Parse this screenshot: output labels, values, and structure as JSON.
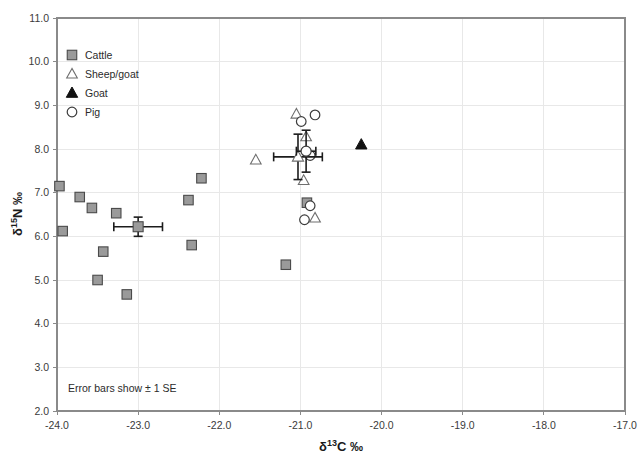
{
  "chart_data": {
    "type": "scatter",
    "title": "",
    "xlabel": "δ13C ‰",
    "ylabel": "δ15N ‰",
    "xlim": [
      -24.0,
      -17.0
    ],
    "ylim": [
      2.0,
      11.0
    ],
    "xticks": [
      "-24.0",
      "-23.0",
      "-22.0",
      "-21.0",
      "-20.0",
      "-19.0",
      "-18.0",
      "-17.0"
    ],
    "yticks": [
      "2.0",
      "3.0",
      "4.0",
      "5.0",
      "6.0",
      "7.0",
      "8.0",
      "9.0",
      "10.0",
      "11.0"
    ],
    "grid": true,
    "legend_position": "top-left",
    "annotation": "Error bars show ± 1 SE",
    "series": [
      {
        "name": "Cattle",
        "marker": "filled-square",
        "color": "#9a9a9a",
        "points": [
          [
            -23.97,
            7.15
          ],
          [
            -23.93,
            6.12
          ],
          [
            -23.72,
            6.9
          ],
          [
            -23.57,
            6.65
          ],
          [
            -23.5,
            5.0
          ],
          [
            -23.43,
            5.65
          ],
          [
            -23.27,
            6.53
          ],
          [
            -23.14,
            4.67
          ],
          [
            -22.38,
            6.83
          ],
          [
            -22.34,
            5.8
          ],
          [
            -22.22,
            7.33
          ],
          [
            -21.18,
            5.35
          ],
          [
            -20.92,
            6.77
          ]
        ]
      },
      {
        "name": "Sheep/goat",
        "marker": "open-triangle",
        "color": "#ffffff",
        "points": [
          [
            -21.55,
            7.75
          ],
          [
            -21.05,
            8.8
          ],
          [
            -20.93,
            8.28
          ],
          [
            -20.96,
            7.28
          ],
          [
            -20.82,
            6.42
          ]
        ]
      },
      {
        "name": "Goat",
        "marker": "filled-triangle",
        "color": "#111111",
        "points": [
          [
            -20.25,
            8.1
          ]
        ]
      },
      {
        "name": "Pig",
        "marker": "open-circle",
        "color": "#ffffff",
        "points": [
          [
            -20.99,
            8.63
          ],
          [
            -20.82,
            8.78
          ],
          [
            -20.88,
            7.85
          ],
          [
            -20.88,
            6.7
          ],
          [
            -20.95,
            6.38
          ]
        ]
      }
    ],
    "means": [
      {
        "name": "Cattle mean",
        "marker": "filled-square",
        "x": -23.0,
        "y": 6.22,
        "xerr": 0.3,
        "yerr": 0.22
      },
      {
        "name": "Sheep/goat mean",
        "marker": "open-triangle",
        "x": -21.03,
        "y": 7.82,
        "xerr": 0.3,
        "yerr": 0.52
      },
      {
        "name": "Pig mean",
        "marker": "open-circle",
        "x": -20.93,
        "y": 7.95,
        "xerr": 0.12,
        "yerr": 0.48
      }
    ]
  },
  "legend": {
    "items": [
      {
        "label": "Cattle",
        "marker": "filled-square"
      },
      {
        "label": "Sheep/goat",
        "marker": "open-triangle"
      },
      {
        "label": "Goat",
        "marker": "filled-triangle"
      },
      {
        "label": "Pig",
        "marker": "open-circle"
      }
    ]
  },
  "axis_titles": {
    "x_delta": "δ",
    "x_sup": "13",
    "x_rest": "C ‰",
    "y_delta": "δ",
    "y_sup": "15",
    "y_rest": "N ‰"
  },
  "annotation": {
    "text": "Error bars show ± 1 SE"
  }
}
